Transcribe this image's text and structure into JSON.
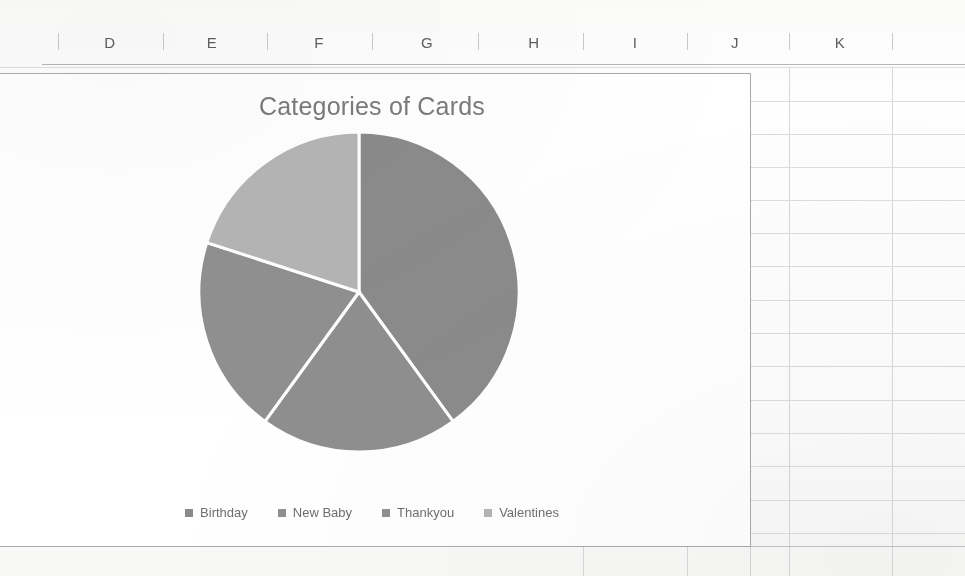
{
  "spreadsheet": {
    "column_headers": [
      "D",
      "E",
      "F",
      "G",
      "H",
      "I",
      "J",
      "K"
    ],
    "grid_visible": true
  },
  "chart_data": {
    "type": "pie",
    "title": "Categories of Cards",
    "xlabel": "",
    "ylabel": "",
    "legend_position": "bottom",
    "grid": false,
    "categories": [
      "Birthday",
      "New Baby",
      "Thankyou",
      "Valentines"
    ],
    "values": [
      40,
      20,
      20,
      20
    ],
    "slice_angles_deg": [
      145,
      71.6,
      71.6,
      72.4
    ],
    "colors": [
      "#8b8b8b",
      "#8f8f8f",
      "#909090",
      "#b5b5b5"
    ],
    "series": [
      {
        "name": "Categories of Cards",
        "values": [
          40,
          20,
          20,
          20
        ]
      }
    ]
  },
  "legend": {
    "items": [
      {
        "label": "Birthday",
        "color": "#8b8b8b"
      },
      {
        "label": "New Baby",
        "color": "#8f8f8f"
      },
      {
        "label": "Thankyou",
        "color": "#909090"
      },
      {
        "label": "Valentines",
        "color": "#b5b5b5"
      }
    ]
  },
  "ghost_text": {
    "a": "",
    "b": "",
    "c": ""
  }
}
